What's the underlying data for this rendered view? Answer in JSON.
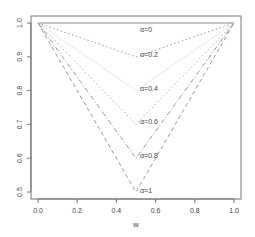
{
  "chart_data": {
    "type": "line",
    "title": "",
    "xlabel": "w",
    "ylabel": "",
    "xlim": [
      0.0,
      1.0
    ],
    "ylim": [
      0.5,
      1.0
    ],
    "grid": false,
    "legend": "inline labels at w=0.5",
    "x_ticks": [
      "0.0",
      "0.2",
      "0.4",
      "0.6",
      "0.8",
      "1.0"
    ],
    "y_ticks": [
      "0.5",
      "0.6",
      "0.7",
      "0.8",
      "0.9",
      "1.0"
    ],
    "x": [
      0.0,
      0.5,
      1.0
    ],
    "series": [
      {
        "name": "α=0",
        "values": [
          1.0,
          1.0,
          1.0
        ],
        "style": "solid",
        "color": "#888888"
      },
      {
        "name": "α=0.2",
        "values": [
          1.0,
          0.9,
          1.0
        ],
        "style": "dotted",
        "color": "#999999"
      },
      {
        "name": "α=0.4",
        "values": [
          1.0,
          0.8,
          1.0
        ],
        "style": "solid",
        "color": "#e6e6e6"
      },
      {
        "name": "α=0.6",
        "values": [
          1.0,
          0.7,
          1.0
        ],
        "style": "dotted",
        "color": "#aaaaaa"
      },
      {
        "name": "α=0.8",
        "values": [
          1.0,
          0.6,
          1.0
        ],
        "style": "dashdot",
        "color": "#999999"
      },
      {
        "name": "α=1",
        "values": [
          1.0,
          0.5,
          1.0
        ],
        "style": "dashed",
        "color": "#999999"
      }
    ]
  }
}
